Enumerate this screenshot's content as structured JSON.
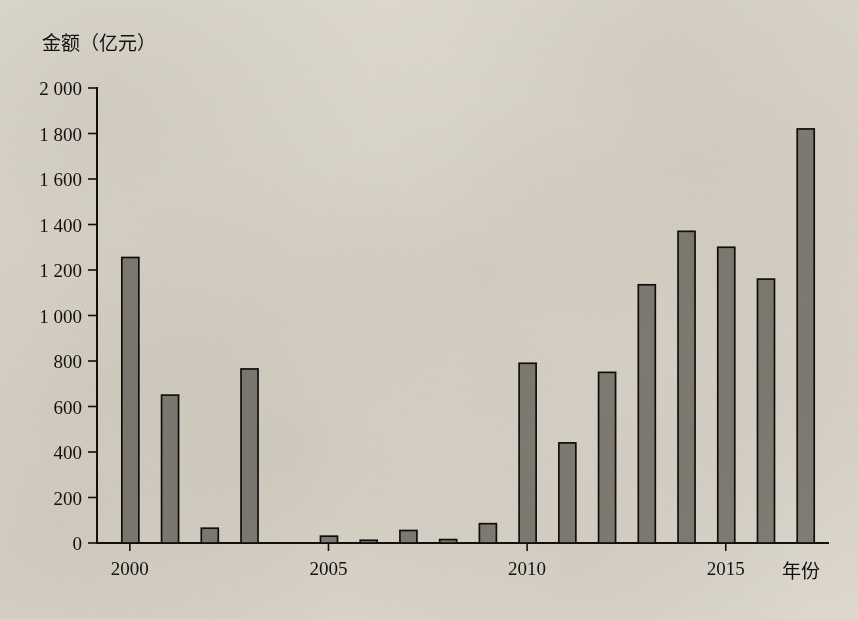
{
  "chart_data": {
    "type": "bar",
    "title": "",
    "subtitle": "",
    "ylabel": "金额（亿元）",
    "xlabel": "年份",
    "ylim": [
      0,
      2000
    ],
    "ytick_step": 200,
    "ytick_labels": [
      "0",
      "200",
      "400",
      "600",
      "800",
      "1 000",
      "1 200",
      "1 400",
      "1 600",
      "1 800",
      "2 000"
    ],
    "ytick_values": [
      0,
      200,
      400,
      600,
      800,
      1000,
      1200,
      1400,
      1600,
      1800,
      2000
    ],
    "xtick_labels": [
      "2000",
      "2005",
      "2010",
      "2015"
    ],
    "xtick_values": [
      2000,
      2005,
      2010,
      2015
    ],
    "xlim": [
      1999.4,
      2017.8
    ],
    "grid": false,
    "legend": null,
    "categories": [
      2000,
      2001,
      2002,
      2003,
      2004,
      2005,
      2006,
      2007,
      2008,
      2009,
      2010,
      2011,
      2012,
      2013,
      2014,
      2015,
      2016,
      2017
    ],
    "values": [
      1255,
      650,
      65,
      765,
      0,
      30,
      12,
      55,
      15,
      85,
      790,
      440,
      750,
      1135,
      1370,
      1300,
      1160,
      1820
    ],
    "bar_color": "#8d8b85",
    "bar_edge_color": "#13110e",
    "background_color": "#efece6"
  },
  "axes": {
    "y_axis_title": "金额（亿元）",
    "x_axis_title": "年份"
  }
}
